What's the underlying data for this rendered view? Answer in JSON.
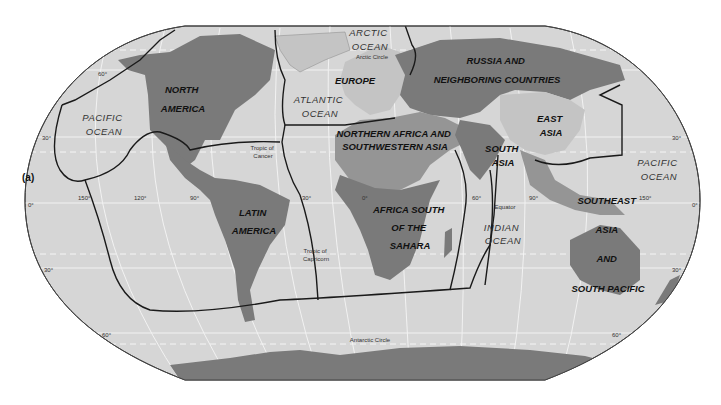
{
  "figure": {
    "caption": "(a)",
    "colors": {
      "background": "#ffffff",
      "ocean": "#d6d6d6",
      "land_dark": "#7a7a7a",
      "land_medium": "#959595",
      "land_light": "#c4c4c4",
      "boundary": "#1a1a1a",
      "graticule": "#f2f2f2"
    }
  },
  "regions": [
    {
      "id": "north-america",
      "lines": [
        "NORTH",
        "AMERICA"
      ]
    },
    {
      "id": "europe",
      "lines": [
        "EUROPE"
      ]
    },
    {
      "id": "russia",
      "lines": [
        "RUSSIA AND",
        "NEIGHBORING COUNTRIES"
      ]
    },
    {
      "id": "east-asia",
      "lines": [
        "EAST",
        "ASIA"
      ]
    },
    {
      "id": "north-africa-sw-asia",
      "lines": [
        "NORTHERN AFRICA AND",
        "SOUTHWESTERN ASIA"
      ]
    },
    {
      "id": "south-asia",
      "lines": [
        "SOUTH",
        "ASIA"
      ]
    },
    {
      "id": "latin-america",
      "lines": [
        "LATIN",
        "AMERICA"
      ]
    },
    {
      "id": "africa-south-sahara",
      "lines": [
        "AFRICA SOUTH",
        "OF THE",
        "SAHARA"
      ]
    },
    {
      "id": "southeast-asia",
      "lines": [
        "SOUTHEAST",
        "ASIA",
        "AND",
        "SOUTH PACIFIC"
      ]
    }
  ],
  "oceans": [
    {
      "id": "arctic",
      "lines": [
        "ARCTIC",
        "OCEAN"
      ]
    },
    {
      "id": "atlantic",
      "lines": [
        "ATLANTIC",
        "OCEAN"
      ]
    },
    {
      "id": "pacific-west",
      "lines": [
        "PACIFIC",
        "OCEAN"
      ]
    },
    {
      "id": "pacific-east",
      "lines": [
        "PACIFIC",
        "OCEAN"
      ]
    },
    {
      "id": "indian",
      "lines": [
        "INDIAN",
        "OCEAN"
      ]
    }
  ],
  "reference_lines": {
    "arctic_circle": "Arctic Circle",
    "tropic_cancer": [
      "Tropic of",
      "Cancer"
    ],
    "equator": "Equator",
    "tropic_capricorn": [
      "Tropic of",
      "Capricorn"
    ],
    "antarctic_circle": "Antarctic Circle"
  },
  "degree_labels": {
    "lat_left": [
      "60°",
      "30°",
      "0°",
      "30°",
      "60°"
    ],
    "lat_right": [
      "30°",
      "0°",
      "30°",
      "60°"
    ],
    "lon": [
      "150°",
      "120°",
      "90°",
      "30°",
      "0°",
      "60°",
      "90°",
      "150°"
    ]
  }
}
